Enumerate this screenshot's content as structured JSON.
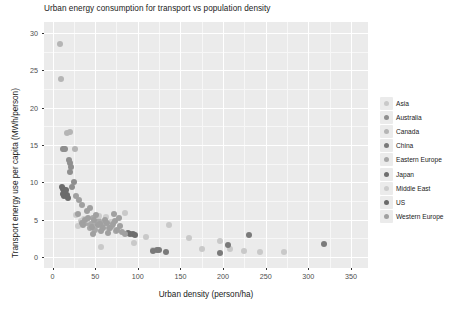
{
  "chart_data": {
    "type": "scatter",
    "title": "Urban energy consumption for transport vs population density",
    "xlabel": "Urban density (person/ha)",
    "ylabel": "Transport energy use per capita (MWh/person)",
    "xlim": [
      -10,
      370
    ],
    "ylim": [
      -1.5,
      31.5
    ],
    "xticks": [
      0,
      50,
      100,
      150,
      200,
      250,
      300,
      350
    ],
    "yticks": [
      0,
      5,
      10,
      15,
      20,
      25,
      30
    ],
    "grid": true,
    "legend_position": "right",
    "legend_title": "",
    "panel_background": "#ebebeb",
    "gridline_color": "#ffffff",
    "series": [
      {
        "name": "Asia",
        "color": "#c9c9c9",
        "points": [
          [
            57,
            1.3
          ],
          [
            60,
            4.6
          ],
          [
            85,
            5.9
          ],
          [
            95,
            1.9
          ],
          [
            110,
            2.6
          ],
          [
            118,
            0.9
          ],
          [
            137,
            4.3
          ],
          [
            160,
            2.5
          ],
          [
            175,
            1.1
          ],
          [
            196,
            2.1
          ],
          [
            208,
            1.0
          ],
          [
            272,
            0.6
          ],
          [
            225,
            0.8
          ],
          [
            243,
            0.7
          ]
        ]
      },
      {
        "name": "Australia",
        "color": "#8f8f8f",
        "points": [
          [
            12,
            14.4
          ],
          [
            14,
            14.5
          ],
          [
            15,
            14.4
          ],
          [
            19,
            13.0
          ],
          [
            20,
            12.6
          ],
          [
            22,
            12.1
          ],
          [
            21,
            11.4
          ],
          [
            25,
            10.1
          ],
          [
            23,
            9.4
          ]
        ]
      },
      {
        "name": "Canada",
        "color": "#b5b5b5",
        "points": [
          [
            9,
            28.6
          ],
          [
            10,
            23.8
          ],
          [
            17,
            16.6
          ],
          [
            20,
            16.7
          ],
          [
            26,
            14.5
          ]
        ]
      },
      {
        "name": "China",
        "color": "#7a7a7a",
        "points": [
          [
            118,
            0.8
          ],
          [
            122,
            0.9
          ],
          [
            125,
            0.9
          ],
          [
            133,
            0.7
          ],
          [
            196,
            0.5
          ],
          [
            206,
            1.6
          ],
          [
            230,
            2.9
          ],
          [
            318,
            1.7
          ]
        ]
      },
      {
        "name": "Eastern Europe",
        "color": "#a8a8a8",
        "points": [
          [
            40,
            4.6
          ],
          [
            45,
            4.4
          ],
          [
            48,
            5.2
          ],
          [
            52,
            4.4
          ],
          [
            55,
            4.8
          ],
          [
            58,
            4.1
          ],
          [
            62,
            4.5
          ],
          [
            66,
            3.8
          ],
          [
            70,
            4.2
          ],
          [
            74,
            3.4
          ],
          [
            50,
            3.6
          ],
          [
            44,
            3.9
          ]
        ]
      },
      {
        "name": "Japan",
        "color": "#6e6e6e",
        "points": [
          [
            88,
            3.2
          ],
          [
            91,
            3.1
          ],
          [
            94,
            3.0
          ],
          [
            97,
            2.9
          ]
        ]
      },
      {
        "name": "Middle East",
        "color": "#cccccc",
        "points": [
          [
            28,
            5.6
          ],
          [
            33,
            4.8
          ],
          [
            37,
            5.1
          ],
          [
            30,
            4.1
          ],
          [
            41,
            4.9
          ],
          [
            54,
            5.5
          ],
          [
            63,
            5.4
          ],
          [
            68,
            4.7
          ]
        ]
      },
      {
        "name": "US",
        "color": "#6b6b6b",
        "points": [
          [
            11,
            9.3
          ],
          [
            12,
            9.1
          ],
          [
            13,
            8.8
          ],
          [
            14,
            9.0
          ],
          [
            15,
            8.6
          ],
          [
            16,
            8.9
          ],
          [
            17,
            8.3
          ],
          [
            13,
            8.1
          ],
          [
            18,
            7.9
          ],
          [
            12,
            8.4
          ]
        ]
      },
      {
        "name": "Western Europe",
        "color": "#a0a0a0",
        "points": [
          [
            30,
            5.7
          ],
          [
            34,
            4.6
          ],
          [
            36,
            4.3
          ],
          [
            38,
            5.0
          ],
          [
            42,
            5.2
          ],
          [
            46,
            4.0
          ],
          [
            49,
            4.9
          ],
          [
            51,
            5.6
          ],
          [
            53,
            4.3
          ],
          [
            56,
            4.4
          ],
          [
            59,
            3.8
          ],
          [
            61,
            5.0
          ],
          [
            64,
            4.6
          ],
          [
            67,
            3.9
          ],
          [
            71,
            4.4
          ],
          [
            73,
            4.8
          ],
          [
            76,
            3.6
          ],
          [
            79,
            4.1
          ],
          [
            82,
            3.3
          ],
          [
            85,
            3.0
          ],
          [
            47,
            3.1
          ],
          [
            57,
            3.4
          ],
          [
            65,
            3.2
          ],
          [
            40,
            6.1
          ],
          [
            44,
            6.5
          ],
          [
            35,
            7.0
          ],
          [
            31,
            7.6
          ],
          [
            27,
            8.1
          ],
          [
            72,
            5.8
          ],
          [
            78,
            5.2
          ]
        ]
      }
    ]
  },
  "axis": {
    "x_tick_labels": [
      "0",
      "50",
      "100",
      "150",
      "200",
      "250",
      "300",
      "350"
    ],
    "y_tick_labels": [
      "0",
      "5",
      "10",
      "15",
      "20",
      "25",
      "30"
    ]
  }
}
